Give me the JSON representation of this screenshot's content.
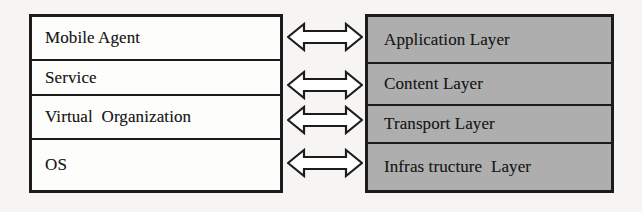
{
  "diagram": {
    "type": "two-column-layer-mapping",
    "background_color": "#f6f5f3",
    "left_column": {
      "name": "agent-stack",
      "fill_color": "#fdfdfc",
      "border_color": "#1c1c1c",
      "cells": [
        {
          "label": "Mobile Agent"
        },
        {
          "label": "Service"
        },
        {
          "label": "Virtual  Organization"
        },
        {
          "label": "OS"
        }
      ]
    },
    "right_column": {
      "name": "layer-stack",
      "fill_color": "#aeaeae",
      "border_color": "#1c1c1c",
      "cells": [
        {
          "label": "Application Layer"
        },
        {
          "label": "Content Layer"
        },
        {
          "label": "Transport Layer"
        },
        {
          "label": "Infras tructure  Layer"
        }
      ]
    },
    "connectors": [
      {
        "name": "connector-1",
        "icon": "double-headed-arrow-icon",
        "from": "Mobile Agent",
        "to": "Application Layer"
      },
      {
        "name": "connector-2",
        "icon": "double-headed-arrow-icon",
        "from": "Service",
        "to": "Content Layer"
      },
      {
        "name": "connector-3",
        "icon": "double-headed-arrow-icon",
        "from": "Virtual  Organization",
        "to": "Transport Layer"
      },
      {
        "name": "connector-4",
        "icon": "double-headed-arrow-icon",
        "from": "OS",
        "to": "Infras tructure  Layer"
      }
    ]
  }
}
